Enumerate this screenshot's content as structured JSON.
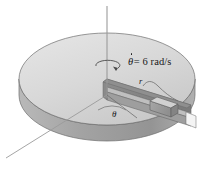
{
  "figure": {
    "background_color": "#ffffff",
    "labels": {
      "angular_velocity_symbol": "θ",
      "angular_velocity_value": "= 6 rad/s",
      "radius": "r",
      "angle": "θ"
    },
    "annotations": {
      "spin_arrow": "circular-rotation-arrow",
      "spin_axis": "vertical-spin-axis-line",
      "reference_axis": "diagonal-reference-axis-line",
      "radius_leader": "curved-leader-line-to-slot",
      "angle_wedge": "angle-between-reference-and-slot"
    },
    "colors": {
      "disk_top": "#d2d2d2",
      "disk_top_light": "#e2e2e2",
      "disk_rim": "#a8a8a8",
      "disk_rim_dark": "#8e8e8e",
      "slot_wall": "#8a8a8a",
      "slot_floor": "#bdbdbd",
      "block_face": "#9a9a9a",
      "block_top": "#cfcfcf",
      "outline": "#5a5a5a",
      "axis_line": "#9a9a9a",
      "text": "#17181a"
    },
    "geometry": {
      "disk_center_x": 107,
      "disk_center_y": 95,
      "disk_radius_x": 88,
      "disk_radius_y": 46,
      "disk_thickness": 16,
      "slot_angle_deg": 0,
      "axis_top_y": 6,
      "reference_axis_end_x": 6,
      "reference_axis_end_y": 158
    }
  }
}
